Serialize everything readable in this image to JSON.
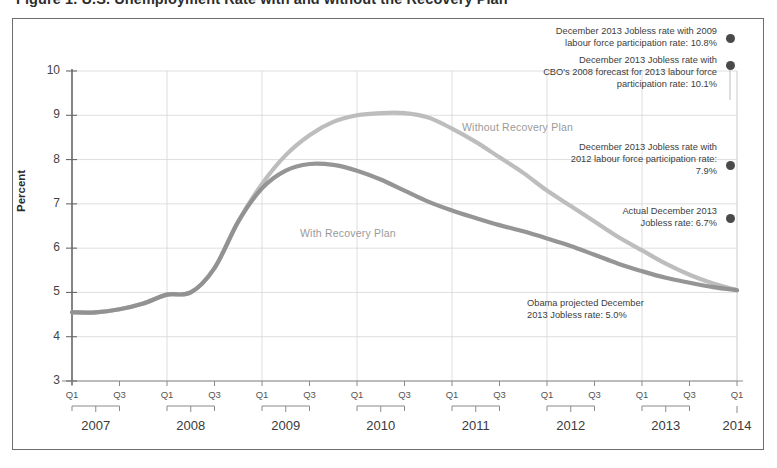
{
  "figure": {
    "title": "Figure 1. U.S. Unemployment Rate with and without the Recovery Plan"
  },
  "chart_data": {
    "type": "line",
    "title": "Figure 1. U.S. Unemployment Rate with and without the Recovery Plan",
    "xlabel": "",
    "ylabel": "Percent",
    "ylim": [
      3,
      10
    ],
    "yticks": [
      3,
      4,
      5,
      6,
      7,
      8,
      9,
      10
    ],
    "grid": true,
    "legend_position": "in-plot-labels",
    "x_quarter_labels": [
      "Q1",
      "Q3"
    ],
    "x_years": [
      "2007",
      "2008",
      "2009",
      "2010",
      "2011",
      "2012",
      "2013",
      "2014"
    ],
    "x": [
      "2007Q1",
      "2007Q2",
      "2007Q3",
      "2007Q4",
      "2008Q1",
      "2008Q2",
      "2008Q3",
      "2008Q4",
      "2009Q1",
      "2009Q2",
      "2009Q3",
      "2009Q4",
      "2010Q1",
      "2010Q2",
      "2010Q3",
      "2010Q4",
      "2011Q1",
      "2011Q2",
      "2011Q3",
      "2011Q4",
      "2012Q1",
      "2012Q2",
      "2012Q3",
      "2012Q4",
      "2013Q1",
      "2013Q2",
      "2013Q3",
      "2013Q4",
      "2014Q1"
    ],
    "series": [
      {
        "name": "Without Recovery Plan",
        "color": "#b9b9b9",
        "values": [
          4.55,
          4.55,
          4.62,
          4.75,
          4.95,
          5.0,
          5.55,
          6.6,
          7.45,
          8.1,
          8.55,
          8.85,
          9.0,
          9.05,
          9.05,
          8.95,
          8.7,
          8.4,
          8.05,
          7.7,
          7.3,
          6.95,
          6.6,
          6.25,
          5.95,
          5.65,
          5.4,
          5.2,
          5.05
        ]
      },
      {
        "name": "With Recovery Plan",
        "color": "#8f8f8f",
        "values": [
          4.55,
          4.55,
          4.62,
          4.75,
          4.95,
          5.0,
          5.55,
          6.6,
          7.35,
          7.75,
          7.9,
          7.88,
          7.75,
          7.55,
          7.3,
          7.05,
          6.85,
          6.68,
          6.52,
          6.38,
          6.22,
          6.05,
          5.85,
          5.65,
          5.48,
          5.33,
          5.22,
          5.12,
          5.05
        ]
      }
    ],
    "annotations": [
      {
        "id": "annot-2009",
        "text": "December 2013 Jobless rate with  2009\nlabour force participation rate: 10.8%",
        "value": 10.8,
        "marker": true
      },
      {
        "id": "annot-cbo",
        "text": "December 2013 Jobless rate with\nCBO's 2008 forecast for 2013 labour force\nparticipation rate: 10.1%",
        "value": 10.1,
        "marker": true
      },
      {
        "id": "annot-2012",
        "text": "December 2013 Jobless rate with\n2012 labour force participation rate:\n7.9%",
        "value": 7.9,
        "marker": true
      },
      {
        "id": "annot-actual",
        "text": "Actual December 2013\nJobless rate: 6.7%",
        "value": 6.7,
        "marker": true
      },
      {
        "id": "annot-obama",
        "text": "Obama  projected December\n2013 Jobless rate: 5.0%",
        "value": 5.0,
        "marker": false
      }
    ]
  },
  "axis": {
    "y_title": "Percent",
    "y_ticks": [
      "10",
      "9",
      "8",
      "7",
      "6",
      "5",
      "4",
      "3"
    ],
    "years": [
      {
        "label": "2007",
        "quarters": [
          "Q1",
          "Q3"
        ]
      },
      {
        "label": "2008",
        "quarters": [
          "Q1",
          "Q3"
        ]
      },
      {
        "label": "2009",
        "quarters": [
          "Q1",
          "Q3"
        ]
      },
      {
        "label": "2010",
        "quarters": [
          "Q1",
          "Q3"
        ]
      },
      {
        "label": "2011",
        "quarters": [
          "Q1",
          "Q3"
        ]
      },
      {
        "label": "2012",
        "quarters": [
          "Q1",
          "Q3"
        ]
      },
      {
        "label": "2013",
        "quarters": [
          "Q1",
          "Q3"
        ]
      },
      {
        "label": "2014",
        "quarters": [
          "Q1"
        ]
      }
    ]
  },
  "series_labels": {
    "without": "Without Recovery Plan",
    "with": "With Recovery Plan"
  }
}
